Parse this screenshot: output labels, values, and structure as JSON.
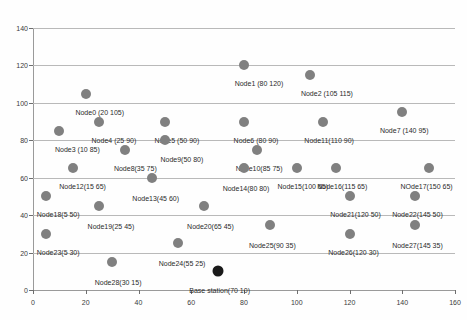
{
  "chart_data": {
    "type": "scatter",
    "title": "",
    "xlabel": "",
    "ylabel": "",
    "xlim": [
      0,
      160
    ],
    "ylim": [
      0,
      140
    ],
    "xticks": [
      0,
      20,
      40,
      60,
      80,
      100,
      120,
      140,
      160
    ],
    "yticks": [
      0,
      20,
      40,
      60,
      80,
      100,
      120,
      140
    ],
    "grid": true,
    "legend": "none",
    "marker_color": "#808080",
    "base_station_color": "#1a1a1a",
    "points": [
      {
        "name": "Node0",
        "label": "Node0 (20 105)",
        "x": 20,
        "y": 105,
        "kind": "node",
        "lx": 20,
        "ly": 105,
        "dx": 14,
        "dy": 15
      },
      {
        "name": "Node1",
        "label": "Node1 (80 120)",
        "x": 80,
        "y": 120,
        "kind": "node",
        "lx": 80,
        "ly": 120,
        "dx": 15,
        "dy": 15
      },
      {
        "name": "Node2",
        "label": "Node2 (105 115)",
        "x": 105,
        "y": 115,
        "kind": "node",
        "lx": 105,
        "ly": 115,
        "dx": 17,
        "dy": 15
      },
      {
        "name": "Node3",
        "label": "Node3 (10 85)",
        "x": 10,
        "y": 85,
        "kind": "node",
        "lx": 10,
        "ly": 85,
        "dx": 18,
        "dy": 15
      },
      {
        "name": "Node4",
        "label": "Node4 (25 90)",
        "x": 25,
        "y": 90,
        "kind": "node",
        "lx": 25,
        "ly": 90,
        "dx": 15,
        "dy": 15
      },
      {
        "name": "Node5",
        "label": "Node5 (50 90)",
        "x": 50,
        "y": 90,
        "kind": "node",
        "lx": 50,
        "ly": 90,
        "dx": 12,
        "dy": 15
      },
      {
        "name": "Node6",
        "label": "Node6 (80 90)",
        "x": 80,
        "y": 90,
        "kind": "node",
        "lx": 80,
        "ly": 90,
        "dx": 12,
        "dy": 15
      },
      {
        "name": "Node7",
        "label": "Node7 (140 95)",
        "x": 140,
        "y": 95,
        "kind": "node",
        "lx": 140,
        "ly": 95,
        "dx": 2,
        "dy": 15
      },
      {
        "name": "Node8",
        "label": "Node8(35 75)",
        "x": 35,
        "y": 75,
        "kind": "node",
        "lx": 35,
        "ly": 75,
        "dx": 10,
        "dy": 15
      },
      {
        "name": "Node9",
        "label": "Node9(50 80)",
        "x": 50,
        "y": 80,
        "kind": "node",
        "lx": 50,
        "ly": 80,
        "dx": 17,
        "dy": 16
      },
      {
        "name": "Node10",
        "label": "Node10(85 75)",
        "x": 85,
        "y": 75,
        "kind": "node",
        "lx": 85,
        "ly": 75,
        "dx": 2,
        "dy": 15
      },
      {
        "name": "Node11",
        "label": "Node11(110 90)",
        "x": 110,
        "y": 90,
        "kind": "node",
        "lx": 110,
        "ly": 90,
        "dx": 6,
        "dy": 15
      },
      {
        "name": "Node12",
        "label": "Node12(15 65)",
        "x": 15,
        "y": 65,
        "kind": "node",
        "lx": 15,
        "ly": 65,
        "dx": 10,
        "dy": 15
      },
      {
        "name": "Node13",
        "label": "Node13(45 60)",
        "x": 45,
        "y": 60,
        "kind": "node",
        "lx": 45,
        "ly": 60,
        "dx": 4,
        "dy": 17
      },
      {
        "name": "Node14",
        "label": "Node14(80 80)",
        "x": 80,
        "y": 65,
        "kind": "node",
        "lx": 80,
        "ly": 65,
        "dx": 2,
        "dy": 17
      },
      {
        "name": "Node15",
        "label": "Node15(100 65)",
        "x": 100,
        "y": 65,
        "kind": "node",
        "lx": 100,
        "ly": 65,
        "dx": 6,
        "dy": 15
      },
      {
        "name": "Node16",
        "label": "Node16(115 65)",
        "x": 115,
        "y": 65,
        "kind": "node",
        "lx": 115,
        "ly": 65,
        "dx": 6,
        "dy": 15
      },
      {
        "name": "Node17",
        "label": "NOde17(150 65)",
        "x": 150,
        "y": 65,
        "kind": "node",
        "lx": 150,
        "ly": 65,
        "dx": -2,
        "dy": 15
      },
      {
        "name": "Node18",
        "label": "Node18(5 50)",
        "x": 5,
        "y": 50,
        "kind": "node",
        "lx": 5,
        "ly": 50,
        "dx": 12,
        "dy": 15
      },
      {
        "name": "Node19",
        "label": "Node19(25 45)",
        "x": 25,
        "y": 45,
        "kind": "node",
        "lx": 25,
        "ly": 45,
        "dx": 12,
        "dy": 17
      },
      {
        "name": "Node20",
        "label": "Node20(65 45)",
        "x": 65,
        "y": 45,
        "kind": "node",
        "lx": 65,
        "ly": 45,
        "dx": 6,
        "dy": 17
      },
      {
        "name": "Node21",
        "label": "Node21(120 50)",
        "x": 120,
        "y": 50,
        "kind": "node",
        "lx": 120,
        "ly": 50,
        "dx": 6,
        "dy": 15
      },
      {
        "name": "Node22",
        "label": "Node22(145 50)",
        "x": 145,
        "y": 50,
        "kind": "node",
        "lx": 145,
        "ly": 50,
        "dx": 2,
        "dy": 15
      },
      {
        "name": "Node23",
        "label": "Node23(5 30)",
        "x": 5,
        "y": 30,
        "kind": "node",
        "lx": 5,
        "ly": 30,
        "dx": 12,
        "dy": 15
      },
      {
        "name": "Node24",
        "label": "Node24(55 25)",
        "x": 55,
        "y": 25,
        "kind": "node",
        "lx": 55,
        "ly": 25,
        "dx": 4,
        "dy": 17
      },
      {
        "name": "Node25",
        "label": "Node25(90 35)",
        "x": 90,
        "y": 35,
        "kind": "node",
        "lx": 90,
        "ly": 35,
        "dx": 2,
        "dy": 17
      },
      {
        "name": "Node26",
        "label": "Node26(120 30)",
        "x": 120,
        "y": 30,
        "kind": "node",
        "lx": 120,
        "ly": 30,
        "dx": 4,
        "dy": 15
      },
      {
        "name": "Node27",
        "label": "Node27(145 35)",
        "x": 145,
        "y": 35,
        "kind": "node",
        "lx": 145,
        "ly": 35,
        "dx": 2,
        "dy": 17
      },
      {
        "name": "Node28",
        "label": "Node28(30 15)",
        "x": 30,
        "y": 15,
        "kind": "node",
        "lx": 30,
        "ly": 15,
        "dx": 6,
        "dy": 17
      },
      {
        "name": "BaseStation",
        "label": "Base station(70 10)",
        "x": 70,
        "y": 10,
        "kind": "base",
        "lx": 70,
        "ly": 10,
        "dx": 2,
        "dy": 16
      }
    ]
  }
}
